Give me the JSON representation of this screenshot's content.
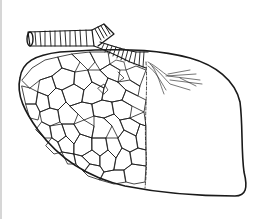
{
  "figure": {
    "parts": [
      "bronchus-main",
      "bronchus-branch",
      "lobe-outline",
      "alveolar-lobules",
      "bronchiole-branches"
    ],
    "colors": {
      "stroke": "#1a1a1a",
      "background": "#ffffff",
      "edge": "#d6d6d6"
    }
  }
}
